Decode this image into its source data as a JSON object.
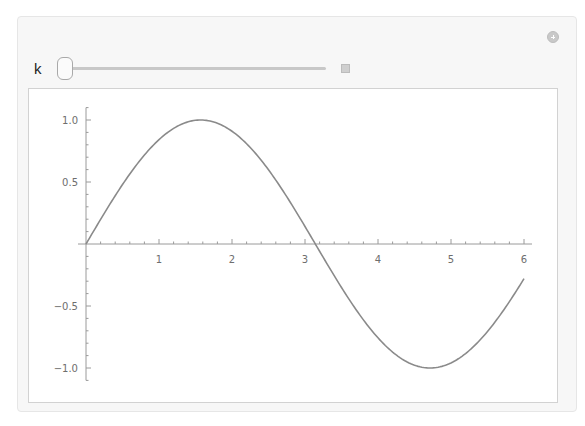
{
  "manipulate": {
    "control": {
      "variable_label": "k",
      "slider_value_position": 0,
      "add_button_icon": "plus-circle-icon",
      "expand_button_icon": "plus-square-icon"
    }
  },
  "chart_data": {
    "type": "line",
    "title": "",
    "xlabel": "",
    "ylabel": "",
    "function": "sin(x)",
    "xlim": [
      0,
      6.0
    ],
    "ylim": [
      -1.0,
      1.0
    ],
    "x_ticks": [
      "1",
      "2",
      "3",
      "4",
      "5",
      "6"
    ],
    "y_ticks": [
      "1.0",
      "0.5",
      "-0.5",
      "-1.0"
    ],
    "grid": false,
    "legend": null,
    "series": [
      {
        "name": "sin(x)",
        "color": "#8a8a8a",
        "x": [
          0,
          0.5,
          1.0,
          1.5708,
          2.0,
          2.5,
          3.0,
          3.1416,
          3.5,
          4.0,
          4.5,
          4.7124,
          5.0,
          5.5,
          6.0
        ],
        "y": [
          0,
          0.479,
          0.841,
          1.0,
          0.909,
          0.598,
          0.141,
          0,
          -0.351,
          -0.757,
          -0.978,
          -1.0,
          -0.959,
          -0.706,
          -0.279
        ]
      }
    ]
  }
}
